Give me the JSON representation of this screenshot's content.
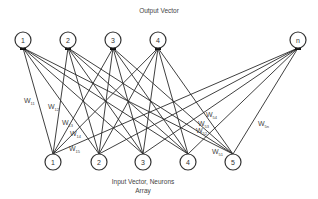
{
  "diagram": {
    "type": "fully-connected bipartite neural network",
    "output_title": "Output Vector",
    "input_title_line1": "Input Vector, Neurons",
    "input_title_line2": "Array",
    "output_nodes": [
      {
        "id": "1",
        "label": "1",
        "x": 23,
        "y": 40
      },
      {
        "id": "2",
        "label": "2",
        "x": 68,
        "y": 40
      },
      {
        "id": "3",
        "label": "3",
        "x": 113,
        "y": 40
      },
      {
        "id": "4",
        "label": "4",
        "x": 158,
        "y": 40
      },
      {
        "id": "n",
        "label": "n",
        "x": 298,
        "y": 40
      }
    ],
    "input_nodes": [
      {
        "id": "1",
        "label": "1",
        "x": 53,
        "y": 162
      },
      {
        "id": "2",
        "label": "2",
        "x": 99,
        "y": 162
      },
      {
        "id": "3",
        "label": "3",
        "x": 143,
        "y": 162
      },
      {
        "id": "4",
        "label": "4",
        "x": 188,
        "y": 162
      },
      {
        "id": "5",
        "label": "5",
        "x": 233,
        "y": 162
      }
    ],
    "weight_labels": [
      {
        "base": "W",
        "sub": "11",
        "x": 24,
        "y": 103
      },
      {
        "base": "W",
        "sub": "12",
        "x": 48,
        "y": 109
      },
      {
        "base": "W",
        "sub": "13",
        "x": 62,
        "y": 125
      },
      {
        "base": "W",
        "sub": "14",
        "x": 70,
        "y": 136
      },
      {
        "base": "W",
        "sub": "15",
        "x": 69,
        "y": 151
      },
      {
        "base": "W",
        "sub": "54",
        "x": 206,
        "y": 117
      },
      {
        "base": "W",
        "sub": "53",
        "x": 198,
        "y": 126
      },
      {
        "base": "W",
        "sub": "52",
        "x": 196,
        "y": 133
      },
      {
        "base": "W",
        "sub": "51",
        "x": 212,
        "y": 154
      },
      {
        "base": "W",
        "sub": "5n",
        "x": 258,
        "y": 126
      }
    ],
    "colors": {
      "edge": "#2a2a2a",
      "node_stroke": "#333333",
      "background": "#ffffff"
    }
  }
}
